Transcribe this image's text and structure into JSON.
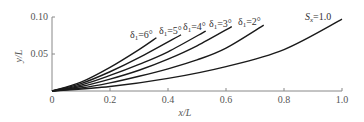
{
  "chart_data": {
    "type": "line",
    "title": "",
    "xlabel": "x/L",
    "ylabel": "y/L",
    "xlim": [
      0,
      1.0
    ],
    "ylim": [
      0,
      0.1
    ],
    "grid": false,
    "legend": "inline labels at curve ends",
    "x_ticks": [
      "0",
      "0.2",
      "0.4",
      "0.6",
      "0.8",
      "1.0"
    ],
    "y_ticks": [
      "0.05",
      "0.10"
    ],
    "series": [
      {
        "name": "δ1=6°",
        "label_main": "δ",
        "label_sub": "1",
        "label_rest": "=6°",
        "x": [
          0,
          0.1,
          0.2,
          0.3,
          0.36
        ],
        "y": [
          0,
          0.012,
          0.032,
          0.056,
          0.072
        ]
      },
      {
        "name": "δ1=5°",
        "label_main": "δ",
        "label_sub": "1",
        "label_rest": "=5°",
        "x": [
          0,
          0.1,
          0.2,
          0.3,
          0.445
        ],
        "y": [
          0,
          0.01,
          0.026,
          0.045,
          0.076
        ]
      },
      {
        "name": "δ1=4°",
        "label_main": "δ",
        "label_sub": "1",
        "label_rest": "=4°",
        "x": [
          0,
          0.1,
          0.2,
          0.3,
          0.4,
          0.53
        ],
        "y": [
          0,
          0.008,
          0.021,
          0.036,
          0.053,
          0.081
        ]
      },
      {
        "name": "δ1=3°",
        "label_main": "δ",
        "label_sub": "1",
        "label_rest": "=3°",
        "x": [
          0,
          0.1,
          0.2,
          0.3,
          0.4,
          0.5,
          0.62
        ],
        "y": [
          0,
          0.006,
          0.016,
          0.028,
          0.043,
          0.061,
          0.087
        ]
      },
      {
        "name": "δ1=2°",
        "label_main": "δ",
        "label_sub": "1",
        "label_rest": "=2°",
        "x": [
          0,
          0.1,
          0.2,
          0.3,
          0.4,
          0.5,
          0.6,
          0.73
        ],
        "y": [
          0,
          0.004,
          0.011,
          0.02,
          0.03,
          0.042,
          0.058,
          0.089
        ]
      },
      {
        "name": "Sx=1.0",
        "label_main": "S",
        "label_sub": "x",
        "label_rest": "=1.0",
        "x": [
          0,
          0.2,
          0.4,
          0.6,
          0.8,
          1.0
        ],
        "y": [
          0,
          0.006,
          0.017,
          0.033,
          0.056,
          0.097
        ]
      }
    ]
  }
}
